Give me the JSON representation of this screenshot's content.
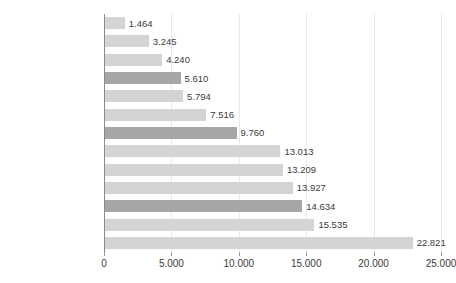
{
  "chart_data": {
    "type": "bar",
    "orientation": "horizontal",
    "title": "",
    "xlabel": "",
    "ylabel": "",
    "xlim": [
      0,
      25000
    ],
    "grid": true,
    "legend": "none",
    "xticks": [
      0,
      5000,
      10000,
      15000,
      20000,
      25000
    ],
    "xtick_labels": [
      "0",
      "5.000",
      "10.000",
      "15.000",
      "20.000",
      "25.000"
    ],
    "categories": [
      "Indonésia",
      "Colômbia",
      "Argentina",
      "Brasil",
      "Lituânia",
      "Portugal",
      "Média Ocde",
      "Reino Unido",
      "Áustria",
      "Noruega",
      "Suíça",
      "Estados Unidos",
      "Luxemburgo"
    ],
    "values": [
      1464,
      3245,
      4240,
      5610,
      5794,
      7516,
      9760,
      13013,
      13209,
      13927,
      14634,
      15535,
      22821
    ],
    "value_labels": [
      "1.464",
      "3.245",
      "4.240",
      "5.610",
      "5.794",
      "7.516",
      "9.760",
      "13.013",
      "13.209",
      "13.927",
      "14.634",
      "15.535",
      "22.821"
    ],
    "highlighted": [
      false,
      false,
      false,
      true,
      false,
      false,
      true,
      false,
      false,
      false,
      true,
      false,
      false
    ],
    "colors": {
      "bar": "#d4d4d4",
      "bar_highlight": "#a6a6a6",
      "gridline": "#e8e8e8",
      "axis": "#8a8a8a",
      "text": "#3b3b3b",
      "background": "#ffffff"
    }
  }
}
